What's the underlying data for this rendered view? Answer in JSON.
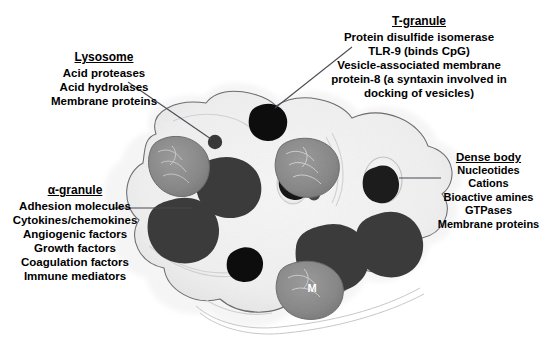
{
  "figure": {
    "background_color": "#ffffff",
    "ink_color": "#000000"
  },
  "labels": {
    "lysosome": {
      "title": "Lysosome",
      "lines": [
        "Acid proteases",
        "Acid hydrolases",
        "Membrane proteins"
      ]
    },
    "t_granule": {
      "title": "T-granule",
      "lines": [
        "Protein disulfide isomerase",
        "TLR-9 (binds CpG)",
        "Vesicle-associated membrane",
        "protein-8 (a syntaxin involved in",
        "docking of vesicles)"
      ]
    },
    "alpha_granule": {
      "title": "α-granule",
      "lines": [
        "Adhesion molecules",
        "Cytokines/chemokines",
        "Angiogenic factors",
        "Growth factors",
        "Coagulation factors",
        "Immune mediators"
      ]
    },
    "dense_body": {
      "title": "Dense body",
      "lines": [
        "Nucleotides",
        "Cations",
        "Bioactive amines",
        "GTPases",
        "Membrane proteins"
      ]
    }
  },
  "organelle_markers": {
    "mitochondrion": "M"
  },
  "colors": {
    "cytoplasm": "#f2f2f2",
    "cytoplasm_rim": "#e3e3e3",
    "membrane_stroke": "#6d6d72",
    "alpha_granule_fill": "#3c3c3c",
    "dark_granule_fill": "#121212",
    "mitochondrion_fill": "#8d8d8d",
    "dense_core_fill": "#1a1a1a",
    "dense_halo_fill": "#efefef",
    "leader_line": "#4a4a52"
  },
  "leaders": [
    {
      "name": "lysosome-leader",
      "from": [
        128,
        82
      ],
      "to": [
        214,
        141
      ]
    },
    {
      "name": "t-granule-leader",
      "from": [
        352,
        47
      ],
      "to": [
        272,
        110
      ]
    },
    {
      "name": "alpha-granule-leader",
      "from": [
        113,
        208
      ],
      "to": [
        190,
        208
      ]
    },
    {
      "name": "dense-body-leader",
      "from": [
        441,
        178
      ],
      "to": [
        383,
        178
      ]
    }
  ],
  "bleed_through_text": " "
}
